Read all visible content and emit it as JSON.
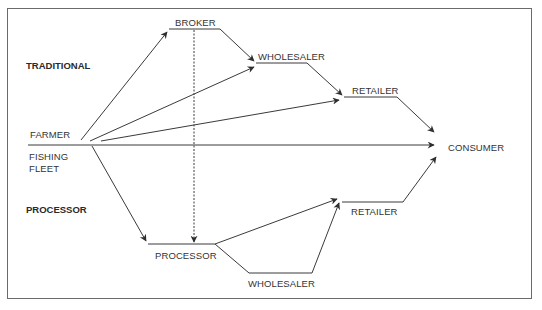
{
  "diagram": {
    "type": "flow-diagram",
    "sections": {
      "traditional": "TRADITIONAL",
      "processor": "PROCESSOR"
    },
    "nodes": {
      "farmer": "FARMER",
      "fishing_fleet_line1": "FISHING",
      "fishing_fleet_line2": "FLEET",
      "broker": "BROKER",
      "wholesaler_traditional": "WHOLESALER",
      "retailer_traditional": "RETAILER",
      "consumer": "CONSUMER",
      "processor": "PROCESSOR",
      "retailer_processor": "RETAILER",
      "wholesaler_processor": "WHOLESALER"
    },
    "edges": [
      {
        "from": "FARMER",
        "to": "BROKER",
        "style": "solid"
      },
      {
        "from": "FARMER",
        "to": "WHOLESALER (traditional)",
        "style": "solid"
      },
      {
        "from": "FARMER",
        "to": "RETAILER (traditional)",
        "style": "solid"
      },
      {
        "from": "FARMER",
        "to": "CONSUMER",
        "style": "solid"
      },
      {
        "from": "FISHING FLEET",
        "to": "PROCESSOR",
        "style": "solid"
      },
      {
        "from": "BROKER",
        "to": "WHOLESALER (traditional)",
        "style": "solid"
      },
      {
        "from": "BROKER",
        "to": "PROCESSOR",
        "style": "dashed"
      },
      {
        "from": "WHOLESALER (traditional)",
        "to": "RETAILER (traditional)",
        "style": "solid"
      },
      {
        "from": "RETAILER (traditional)",
        "to": "CONSUMER",
        "style": "solid"
      },
      {
        "from": "PROCESSOR",
        "to": "RETAILER (processor)",
        "style": "solid"
      },
      {
        "from": "PROCESSOR",
        "to": "WHOLESALER (processor)",
        "style": "solid"
      },
      {
        "from": "WHOLESALER (processor)",
        "to": "RETAILER (processor)",
        "style": "solid"
      },
      {
        "from": "RETAILER (processor)",
        "to": "CONSUMER",
        "style": "solid"
      }
    ],
    "colors": {
      "line": "#3a3a3a",
      "text": "#333333",
      "frame": "#6a6a6a",
      "background": "#ffffff"
    }
  }
}
